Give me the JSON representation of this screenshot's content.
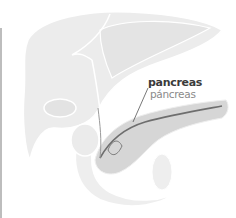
{
  "figure": {
    "highlighted_organ": "pancreas",
    "labels": {
      "english": "pancreas",
      "spanish": "páncreas"
    },
    "colors": {
      "organ_fill": "#ececec",
      "organ_outline": "#ffffff",
      "pancreas_fill": "#d6d6d6",
      "pancreas_duct": "#6e6e6e",
      "leader_line": "#555555",
      "label_primary": "#3a3a3a",
      "label_secondary": "#8a8a8a"
    }
  }
}
